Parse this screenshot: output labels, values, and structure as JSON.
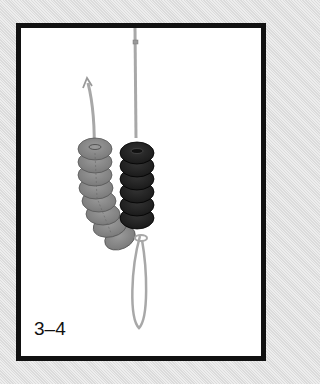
{
  "figure": {
    "step_label": "3–4",
    "colors": {
      "background": "#e4e4e4",
      "frame_border": "#111111",
      "panel": "#ffffff",
      "light_bead": "#8a8a8a",
      "dark_bead": "#262626",
      "thread": "#a8a8a8"
    },
    "beads": {
      "light_column_count": 8,
      "dark_column_count": 6
    }
  }
}
